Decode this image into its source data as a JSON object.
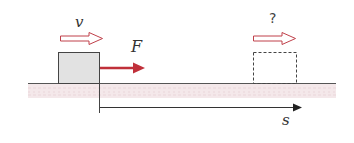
{
  "diagram": {
    "labels": {
      "velocity_initial": "v",
      "force": "F",
      "velocity_final": "?",
      "displacement": "s"
    },
    "colors": {
      "force_arrow": "#c0303a",
      "velocity_arrow_outline": "#c0404a",
      "ground_line": "#555555",
      "ground_hatch": "#f3e6e8",
      "block_fill": "#e4e4e4",
      "block_outline": "#444444",
      "dashed_block_outline": "#444444",
      "axis": "#333333"
    },
    "elements": {
      "block_initial": {
        "x": 58,
        "y": 52,
        "w": 41,
        "h": 31,
        "style": "solid"
      },
      "block_final": {
        "x": 253,
        "y": 52,
        "w": 43,
        "h": 31,
        "style": "dashed"
      },
      "ground": {
        "x1": 28,
        "x2": 335,
        "y": 83
      },
      "displacement_axis": {
        "x1": 100,
        "x2": 300,
        "y": 107
      },
      "force_arrow": {
        "x1": 100,
        "x2": 145,
        "y": 68
      }
    }
  }
}
